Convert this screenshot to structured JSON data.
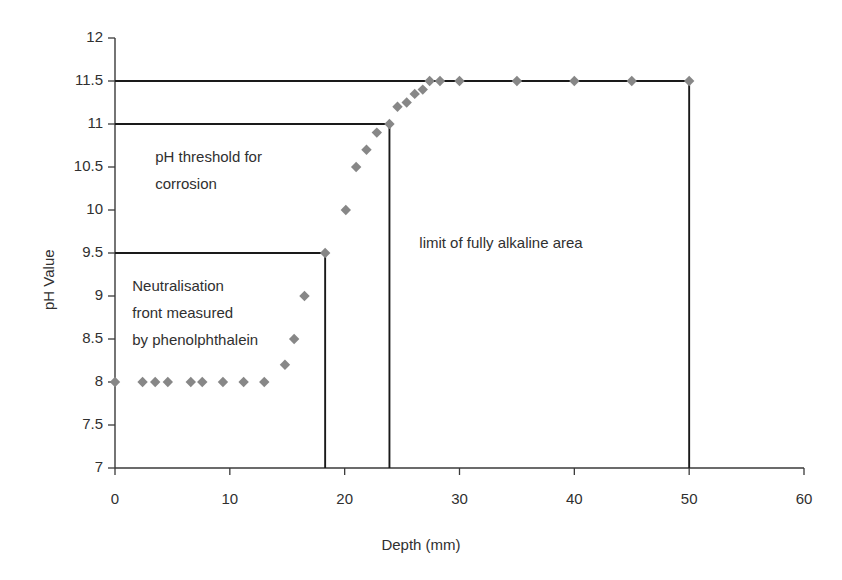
{
  "chart_data": {
    "type": "scatter",
    "title": "",
    "xlabel": "Depth (mm)",
    "ylabel": "pH Value",
    "xlim": [
      0,
      60
    ],
    "ylim": [
      7,
      12
    ],
    "xticks": [
      0,
      10,
      20,
      30,
      40,
      50,
      60
    ],
    "xtick_labels": [
      "0",
      "10",
      "20",
      "30",
      "40",
      "50",
      "60"
    ],
    "yticks": [
      7,
      7.5,
      8,
      8.5,
      9,
      9.5,
      10,
      10.5,
      11,
      11.5,
      12
    ],
    "ytick_labels": [
      "7",
      "7.5",
      "8",
      "8.5",
      "9",
      "9.5",
      "10",
      "10.5",
      "11",
      "11.5",
      "12"
    ],
    "grid": false,
    "legend": "none",
    "marker": "diamond",
    "marker_color": "#878787",
    "line_color": "#1a1a1a",
    "series": [
      {
        "name": "pH profile",
        "marker": "diamond",
        "color": "#878787",
        "points": [
          [
            0.0,
            8.0
          ],
          [
            2.4,
            8.0
          ],
          [
            3.5,
            8.0
          ],
          [
            4.6,
            8.0
          ],
          [
            6.6,
            8.0
          ],
          [
            7.6,
            8.0
          ],
          [
            9.4,
            8.0
          ],
          [
            11.2,
            8.0
          ],
          [
            13.0,
            8.0
          ],
          [
            14.8,
            8.2
          ],
          [
            15.6,
            8.5
          ],
          [
            16.5,
            9.0
          ],
          [
            18.3,
            9.5
          ],
          [
            20.1,
            10.0
          ],
          [
            21.0,
            10.5
          ],
          [
            21.9,
            10.7
          ],
          [
            22.8,
            10.9
          ],
          [
            23.9,
            11.0
          ],
          [
            24.6,
            11.2
          ],
          [
            25.4,
            11.25
          ],
          [
            26.1,
            11.35
          ],
          [
            26.8,
            11.4
          ],
          [
            27.4,
            11.5
          ],
          [
            28.3,
            11.5
          ],
          [
            30.0,
            11.5
          ],
          [
            35.0,
            11.5
          ],
          [
            40.0,
            11.5
          ],
          [
            45.0,
            11.5
          ],
          [
            50.0,
            11.5
          ]
        ]
      }
    ],
    "reference_steps": [
      {
        "name": "ph-11-5-step",
        "label": "limit of fully alkaline area",
        "level": 11.5,
        "extent": 50.0
      },
      {
        "name": "ph-11-step",
        "label": "pH threshold for corrosion",
        "level": 11.0,
        "extent": 23.9
      },
      {
        "name": "ph-9-5-step",
        "label": "Neutralisation front measured by phenolphthalein",
        "level": 9.5,
        "extent": 18.3
      }
    ],
    "annotations": [
      {
        "id": "ph-threshold",
        "lines": [
          "pH threshold for",
          "corrosion"
        ],
        "x_data": 3.5,
        "y_data": 10.62
      },
      {
        "id": "neutralisation-front",
        "lines": [
          "Neutralisation",
          "front measured",
          "by phenolphthalein"
        ],
        "x_data": 1.5,
        "y_data": 9.12
      },
      {
        "id": "alkaline-limit",
        "lines": [
          "limit of fully alkaline area"
        ],
        "x_data": 26.5,
        "y_data": 9.62
      }
    ]
  },
  "figure": {
    "background": "#ffffff",
    "axis_color": "#3a3a3a",
    "text_color": "#303030"
  }
}
